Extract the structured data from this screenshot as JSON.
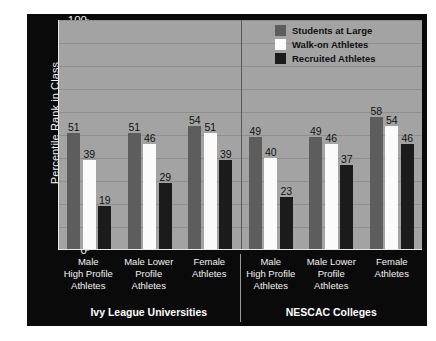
{
  "chart_data": {
    "type": "bar",
    "title": "",
    "xlabel": "",
    "ylabel": "Percentile Rank in Class",
    "ylim": [
      0,
      100
    ],
    "ytick_labels": [
      "100",
      "90",
      "80",
      "70",
      "60",
      "50",
      "40",
      "30",
      "20",
      "10",
      "0"
    ],
    "ytick_values": [
      100,
      90,
      80,
      70,
      60,
      50,
      40,
      30,
      20,
      10,
      0
    ],
    "grid": true,
    "legend_position": "top-right",
    "series": [
      {
        "name": "Students at Large",
        "color": "#5d5d5d",
        "values": [
          51,
          51,
          54,
          49,
          49,
          58
        ]
      },
      {
        "name": "Walk-on Athletes",
        "color": "#fbfbfb",
        "values": [
          39,
          46,
          51,
          40,
          46,
          54
        ]
      },
      {
        "name": "Recruited Athletes",
        "color": "#1b1b1b",
        "values": [
          19,
          29,
          39,
          23,
          37,
          46
        ]
      }
    ],
    "categories": [
      "Male High Profile Athletes",
      "Male Lower Profile Athletes",
      "Female Athletes",
      "Male High Profile Athletes",
      "Male Lower Profile Athletes",
      "Female Athletes"
    ],
    "groups": [
      {
        "title": "Ivy League Universities",
        "categories": [
          {
            "lines": [
              "Male",
              "High Profile",
              "Athletes"
            ]
          },
          {
            "lines": [
              "Male Lower",
              "Profile",
              "Athletes"
            ]
          },
          {
            "lines": [
              "Female",
              "Athletes"
            ]
          }
        ],
        "bars": [
          {
            "students": 51,
            "walkon": 39,
            "recruited": 19
          },
          {
            "students": 51,
            "walkon": 46,
            "recruited": 29
          },
          {
            "students": 54,
            "walkon": 51,
            "recruited": 39
          }
        ]
      },
      {
        "title": "NESCAC Colleges",
        "categories": [
          {
            "lines": [
              "Male",
              "High Profile",
              "Athletes"
            ]
          },
          {
            "lines": [
              "Male Lower",
              "Profile",
              "Athletes"
            ]
          },
          {
            "lines": [
              "Female",
              "Athletes"
            ]
          }
        ],
        "bars": [
          {
            "students": 49,
            "walkon": 40,
            "recruited": 23
          },
          {
            "students": 49,
            "walkon": 46,
            "recruited": 37
          },
          {
            "students": 58,
            "walkon": 54,
            "recruited": 46
          }
        ]
      }
    ]
  },
  "colors": {
    "frame_background": "#0a0a0a",
    "plot_background": "#a3a3a3",
    "gridline": "#8e8e8e",
    "axis": "#e8e8e8",
    "students_at_large": "#5d5d5d",
    "walk_on_athletes": "#fbfbfb",
    "recruited_athletes": "#1b1b1b",
    "label_text": "#f2f2f2"
  }
}
